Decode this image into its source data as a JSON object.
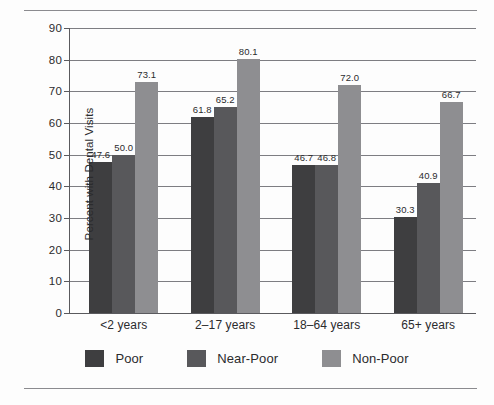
{
  "chart_data": {
    "type": "bar",
    "title": "",
    "xlabel": "",
    "ylabel": "Percent with Dental Visits",
    "categories": [
      "<2 years",
      "2–17 years",
      "18–64 years",
      "65+ years"
    ],
    "series": [
      {
        "name": "Poor",
        "color": "#3e3e40",
        "values": [
          47.6,
          61.8,
          46.7,
          30.3
        ]
      },
      {
        "name": "Near-Poor",
        "color": "#58585b",
        "values": [
          50.0,
          65.2,
          46.8,
          40.9
        ]
      },
      {
        "name": "Non-Poor",
        "color": "#8e8e91",
        "values": [
          73.1,
          80.1,
          72.0,
          66.7
        ]
      }
    ],
    "value_labels": [
      [
        "47.6",
        "50.0",
        "73.1"
      ],
      [
        "61.8",
        "65.2",
        "80.1"
      ],
      [
        "46.7",
        "46.8",
        "72.0"
      ],
      [
        "30.3",
        "40.9",
        "66.7"
      ]
    ],
    "ylim": [
      0,
      90
    ],
    "yticks": [
      0,
      10,
      20,
      30,
      40,
      50,
      60,
      70,
      80,
      90
    ],
    "ytick_labels": [
      "0",
      "10",
      "20",
      "30",
      "40",
      "50",
      "60",
      "70",
      "80",
      "90"
    ],
    "grid": true,
    "grid_axis": "y",
    "legend_position": "bottom",
    "legend": [
      "Poor",
      "Near-Poor",
      "Non-Poor"
    ]
  },
  "legend": {
    "items": [
      {
        "label": "Poor"
      },
      {
        "label": "Near-Poor"
      },
      {
        "label": "Non-Poor"
      }
    ]
  },
  "axis": {
    "y_title": "Percent with Dental Visits"
  },
  "colors": {
    "series_poor": "#3e3e40",
    "series_near_poor": "#58585b",
    "series_non_poor": "#8e8e91",
    "grid": "#7d7d82",
    "axis": "#5a5a5e",
    "rule": "#8b8b8f",
    "text": "#2b2b2d",
    "background": "#fdfdfd"
  }
}
